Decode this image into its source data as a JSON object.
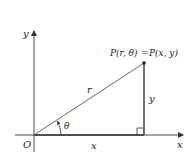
{
  "diagram": {
    "type": "polar-cartesian-relation",
    "axes": {
      "x_label": "x",
      "y_label": "y",
      "origin_label": "O"
    },
    "point": {
      "label_left": "P(r, θ)",
      "equals": "=",
      "label_right": "P(x, y)"
    },
    "segments": {
      "hypotenuse_label": "r",
      "vertical_label": "y",
      "horizontal_label": "x"
    },
    "angle_label": "θ",
    "colors": {
      "line": "#333333",
      "text": "#222222",
      "background": "#ffffff"
    }
  }
}
